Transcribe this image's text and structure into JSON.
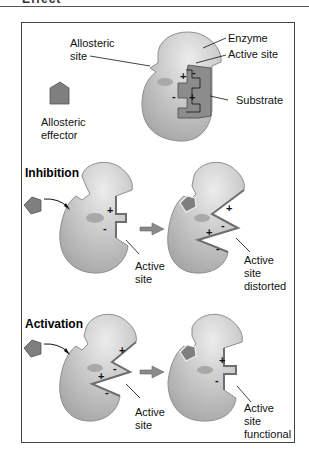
{
  "header": {
    "title_fragment": "Effect"
  },
  "colors": {
    "enzyme_fill": "#c9c9c9",
    "enzyme_shadow": "#a9a9a9",
    "enzyme_highlight": "#e4e4e4",
    "effector_fill": "#7f7f7f",
    "substrate_fill": "#8c8c8c",
    "site_edge": "#6e6e6e",
    "arrow": "#8a8a8a",
    "line": "#111111"
  },
  "panel_top": {
    "labels": {
      "allosteric_site_1": "Allosteric",
      "allosteric_site_2": "site",
      "enzyme": "Enzyme",
      "active_site": "Active site",
      "substrate": "Substrate",
      "allosteric_effector_1": "Allosteric",
      "allosteric_effector_2": "effector"
    },
    "charges": [
      "+",
      "-",
      "-",
      "+"
    ]
  },
  "panel_inhibition": {
    "heading": "Inhibition",
    "left_label_1": "Active",
    "left_label_2": "site",
    "right_label_1": "Active",
    "right_label_2": "site",
    "right_label_3": "distorted",
    "left_charges": [
      "+",
      "-"
    ],
    "right_charges": [
      "+",
      "-",
      "+",
      "-"
    ]
  },
  "panel_activation": {
    "heading": "Activation",
    "left_label_1": "Active",
    "left_label_2": "site",
    "right_label_1": "Active",
    "right_label_2": "site",
    "right_label_3": "functional",
    "left_charges": [
      "+",
      "-",
      "+",
      "-"
    ],
    "right_charges": [
      "+",
      "-"
    ]
  }
}
